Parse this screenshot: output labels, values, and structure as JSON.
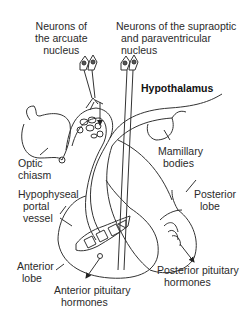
{
  "diagram": {
    "type": "anatomical",
    "labels": {
      "arcuate": [
        "Neurons of",
        "the arcuate",
        "nucleus"
      ],
      "supraoptic": [
        "Neurons of the supraoptic",
        "and paraventricular",
        "nucleus"
      ],
      "hypothalamus": "Hypothalamus",
      "optic_chiasm": [
        "Optic",
        "chiasm"
      ],
      "mamillary": [
        "Mamillary",
        "bodies"
      ],
      "portal_vessel": [
        "Hypophyseal",
        "portal",
        "vessel"
      ],
      "posterior_lobe": [
        "Posterior",
        "lobe"
      ],
      "anterior_lobe": [
        "Anterior",
        "lobe"
      ],
      "anterior_hormones": [
        "Anterior pituitary",
        "hormones"
      ],
      "posterior_hormones": [
        "Posterior pituitary",
        "hormones"
      ]
    },
    "colors": {
      "line": "#333333",
      "text": "#2a2a2a",
      "neuron_nucleus": "#555555"
    }
  }
}
